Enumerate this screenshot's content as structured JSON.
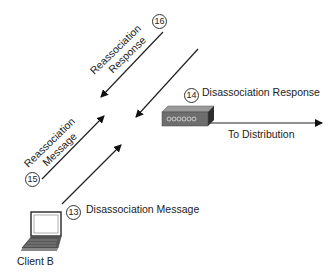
{
  "diagram": {
    "nodes": {
      "client": {
        "label": "Client B",
        "icon": "laptop-icon"
      },
      "access_point": {
        "icon": "access-point-icon"
      }
    },
    "steps": [
      {
        "number": "13",
        "label": "Disassociation Message",
        "direction": "client-to-ap"
      },
      {
        "number": "14",
        "label": "Disassociation Response",
        "direction": "ap-to-client"
      },
      {
        "number": "15",
        "label_line1": "Reassociation",
        "label_line2": "Message",
        "direction": "client-to-new-ap"
      },
      {
        "number": "16",
        "label_line1": "Reassociation",
        "label_line2": "Response",
        "direction": "new-ap-to-client"
      }
    ],
    "distribution": {
      "label": "To Distribution"
    }
  }
}
